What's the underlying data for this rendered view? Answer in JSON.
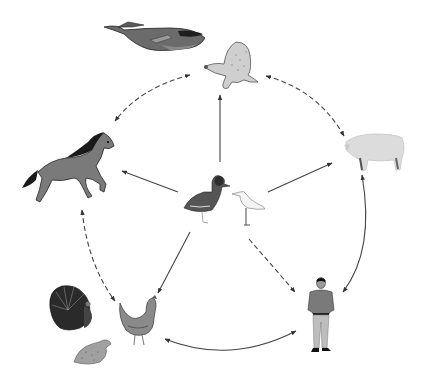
{
  "diagram": {
    "type": "transmission-network",
    "background": "#ffffff",
    "nodes": [
      {
        "id": "wild-birds",
        "label": "wild birds (duck, shorebird)",
        "icon": "duck-icon",
        "x": 222,
        "y": 200
      },
      {
        "id": "marine-mammals",
        "label": "marine mammals (whale, seal)",
        "icon": "seal-icon",
        "x": 225,
        "y": 65
      },
      {
        "id": "horse",
        "label": "horse",
        "icon": "horse-icon",
        "x": 68,
        "y": 168
      },
      {
        "id": "pig",
        "label": "pig",
        "icon": "pig-icon",
        "x": 372,
        "y": 152
      },
      {
        "id": "poultry",
        "label": "poultry (turkey, chicken, quail)",
        "icon": "chicken-icon",
        "x": 120,
        "y": 322
      },
      {
        "id": "human",
        "label": "human",
        "icon": "human-icon",
        "x": 320,
        "y": 315
      }
    ],
    "edges": [
      {
        "from": "wild-birds",
        "to": "marine-mammals",
        "style": "solid",
        "direction": "one-way"
      },
      {
        "from": "wild-birds",
        "to": "horse",
        "style": "solid",
        "direction": "one-way"
      },
      {
        "from": "wild-birds",
        "to": "pig",
        "style": "solid",
        "direction": "one-way"
      },
      {
        "from": "wild-birds",
        "to": "poultry",
        "style": "solid",
        "direction": "one-way"
      },
      {
        "from": "wild-birds",
        "to": "human",
        "style": "dashed",
        "direction": "one-way"
      },
      {
        "from": "marine-mammals",
        "to": "horse",
        "style": "dashed",
        "direction": "two-way"
      },
      {
        "from": "marine-mammals",
        "to": "pig",
        "style": "dashed",
        "direction": "two-way"
      },
      {
        "from": "horse",
        "to": "poultry",
        "style": "dashed",
        "direction": "two-way"
      },
      {
        "from": "pig",
        "to": "human",
        "style": "solid",
        "direction": "two-way"
      },
      {
        "from": "poultry",
        "to": "human",
        "style": "solid",
        "direction": "two-way"
      }
    ],
    "colors": {
      "arrow": "#333333",
      "whale": "#6b6b6b",
      "seal": "#c9c9c9",
      "horse": "#7a7a7a",
      "pig": "#dcdcdc",
      "duck": "#555555",
      "shorebird": "#f4f4f4",
      "turkey": "#2a2a2a",
      "chicken": "#8a8a8a",
      "quail": "#a0a0a0",
      "human_shirt": "#7a7a7a",
      "human_pants": "#bdbdbd"
    }
  }
}
